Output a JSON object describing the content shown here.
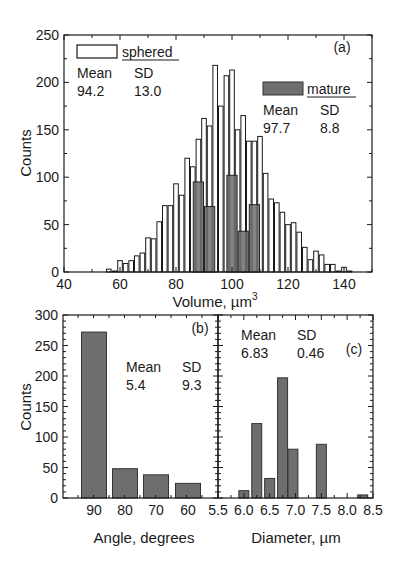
{
  "chart_data": [
    {
      "panel": "(a)",
      "type": "bar",
      "title": "",
      "xlabel": "Volume, µm",
      "xlabel_sup": "3",
      "ylabel": "Counts",
      "xlim": [
        40,
        150
      ],
      "ylim": [
        0,
        250
      ],
      "xticks": [
        "40",
        "60",
        "80",
        "100",
        "120",
        "140"
      ],
      "yticks": [
        "0",
        "50",
        "100",
        "150",
        "200",
        "250"
      ],
      "grid": false,
      "series": [
        {
          "name": "sphered",
          "style": "open",
          "stats": {
            "mean_label": "Mean",
            "sd_label": "SD",
            "mean": "94.2",
            "sd": "13.0"
          },
          "x": [
            56,
            58,
            60,
            62,
            64,
            66,
            68,
            70,
            72,
            74,
            76,
            78,
            80,
            82,
            84,
            86,
            88,
            90,
            92,
            94,
            96,
            98,
            100,
            102,
            104,
            106,
            108,
            110,
            112,
            114,
            116,
            118,
            120,
            122,
            124,
            126,
            128,
            130,
            132,
            134,
            136,
            138,
            140,
            142
          ],
          "values": [
            3,
            1,
            12,
            9,
            12,
            17,
            20,
            36,
            35,
            53,
            70,
            70,
            93,
            81,
            120,
            111,
            140,
            162,
            154,
            218,
            175,
            207,
            213,
            150,
            165,
            138,
            138,
            143,
            104,
            77,
            73,
            63,
            50,
            52,
            42,
            26,
            13,
            22,
            18,
            8,
            8,
            1,
            5,
            1
          ]
        },
        {
          "name": "mature",
          "style": "filled",
          "color": "#6e6e6e",
          "stats": {
            "mean_label": "Mean",
            "sd_label": "SD",
            "mean": "97.7",
            "sd": "8.8"
          },
          "x": [
            88,
            92,
            96,
            100,
            104,
            108
          ],
          "values": [
            95,
            69,
            0,
            102,
            43,
            71
          ]
        }
      ]
    },
    {
      "panel": "(b)",
      "type": "bar",
      "xlabel": "Angle, degrees",
      "ylabel": "Counts",
      "ylim": [
        0,
        300
      ],
      "yticks": [
        "0",
        "50",
        "100",
        "150",
        "200",
        "250",
        "300"
      ],
      "categories": [
        "90",
        "80",
        "70",
        "60"
      ],
      "values": [
        272,
        48,
        38,
        24
      ],
      "color": "#6e6e6e",
      "stats": {
        "mean_label": "Mean",
        "sd_label": "SD",
        "mean": "5.4",
        "sd": "9.3"
      }
    },
    {
      "panel": "(c)",
      "type": "bar",
      "xlabel": "Diameter, µm",
      "ylabel": "Counts",
      "xlim": [
        5.5,
        8.5
      ],
      "ylim": [
        0,
        300
      ],
      "xticks": [
        "5.5",
        "6.0",
        "6.5",
        "7.0",
        "7.5",
        "8.0",
        "8.5"
      ],
      "x": [
        6.0,
        6.25,
        6.5,
        6.75,
        6.95,
        7.5,
        8.3
      ],
      "values": [
        12,
        122,
        32,
        197,
        80,
        88,
        5
      ],
      "color": "#6e6e6e",
      "stats": {
        "mean_label": "Mean",
        "sd_label": "SD",
        "mean": "6.83",
        "sd": "0.46"
      }
    }
  ]
}
